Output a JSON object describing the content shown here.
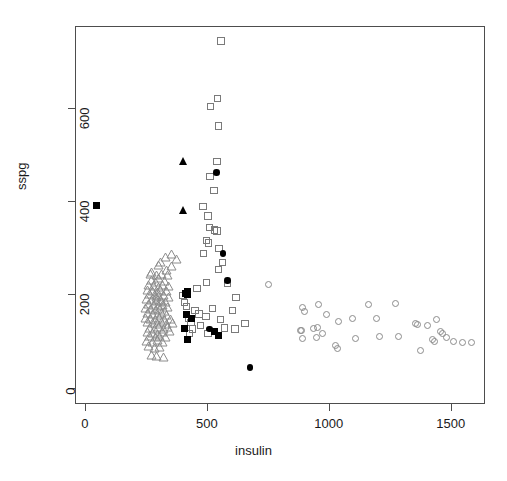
{
  "chart_data": {
    "type": "scatter",
    "title": "",
    "xlabel": "insulin",
    "ylabel": "sspg",
    "xlim": [
      -40,
      1640
    ],
    "ylim": [
      -35,
      775
    ],
    "grid": false,
    "legend": "none",
    "xticks": [
      0,
      500,
      1000,
      1500
    ],
    "xticklabels": [
      "0",
      "500",
      "1000",
      "1500"
    ],
    "yticks": [
      0,
      200,
      400,
      600
    ],
    "yticklabels": [
      "0",
      "200",
      "400",
      "600"
    ],
    "series": [
      {
        "name": "normal",
        "marker": "triangle-open",
        "color": "#8c8c8c",
        "points": [
          [
            352,
            288
          ],
          [
            328,
            283
          ],
          [
            370,
            277
          ],
          [
            305,
            272
          ],
          [
            300,
            265
          ],
          [
            350,
            262
          ],
          [
            265,
            245
          ],
          [
            288,
            243
          ],
          [
            312,
            246
          ],
          [
            333,
            244
          ],
          [
            300,
            238
          ],
          [
            268,
            232
          ],
          [
            286,
            228
          ],
          [
            322,
            231
          ],
          [
            258,
            222
          ],
          [
            278,
            220
          ],
          [
            296,
            218
          ],
          [
            314,
            222
          ],
          [
            340,
            220
          ],
          [
            252,
            212
          ],
          [
            272,
            210
          ],
          [
            292,
            208
          ],
          [
            308,
            212
          ],
          [
            330,
            209
          ],
          [
            260,
            202
          ],
          [
            280,
            200
          ],
          [
            300,
            198
          ],
          [
            318,
            200
          ],
          [
            338,
            196
          ],
          [
            248,
            192
          ],
          [
            268,
            190
          ],
          [
            288,
            188
          ],
          [
            306,
            190
          ],
          [
            326,
            186
          ],
          [
            256,
            182
          ],
          [
            276,
            180
          ],
          [
            296,
            178
          ],
          [
            314,
            180
          ],
          [
            334,
            176
          ],
          [
            246,
            172
          ],
          [
            266,
            170
          ],
          [
            286,
            168
          ],
          [
            304,
            170
          ],
          [
            324,
            166
          ],
          [
            254,
            162
          ],
          [
            274,
            160
          ],
          [
            294,
            158
          ],
          [
            312,
            162
          ],
          [
            332,
            158
          ],
          [
            244,
            152
          ],
          [
            264,
            150
          ],
          [
            284,
            148
          ],
          [
            302,
            152
          ],
          [
            322,
            148
          ],
          [
            252,
            142
          ],
          [
            272,
            140
          ],
          [
            292,
            138
          ],
          [
            310,
            142
          ],
          [
            330,
            138
          ],
          [
            262,
            130
          ],
          [
            282,
            128
          ],
          [
            300,
            132
          ],
          [
            320,
            128
          ],
          [
            254,
            122
          ],
          [
            274,
            120
          ],
          [
            294,
            118
          ],
          [
            314,
            122
          ],
          [
            342,
            124
          ],
          [
            262,
            112
          ],
          [
            284,
            110
          ],
          [
            304,
            113
          ],
          [
            326,
            110
          ],
          [
            250,
            102
          ],
          [
            272,
            100
          ],
          [
            292,
            104
          ],
          [
            316,
            100
          ],
          [
            258,
            92
          ],
          [
            280,
            88
          ],
          [
            302,
            90
          ],
          [
            268,
            72
          ],
          [
            290,
            70
          ],
          [
            318,
            68
          ],
          [
            336,
            132
          ],
          [
            346,
            150
          ],
          [
            356,
            140
          ],
          [
            290,
            196
          ],
          [
            310,
            188
          ],
          [
            270,
            250
          ],
          [
            330,
            255
          ]
        ]
      },
      {
        "name": "chemical",
        "marker": "square-open",
        "color": "#7a7a7a",
        "points": [
          [
            555,
            745
          ],
          [
            540,
            622
          ],
          [
            512,
            605
          ],
          [
            543,
            563
          ],
          [
            538,
            487
          ],
          [
            510,
            455
          ],
          [
            525,
            425
          ],
          [
            480,
            390
          ],
          [
            500,
            370
          ],
          [
            508,
            345
          ],
          [
            528,
            340
          ],
          [
            538,
            338
          ],
          [
            495,
            318
          ],
          [
            503,
            312
          ],
          [
            545,
            300
          ],
          [
            482,
            290
          ],
          [
            560,
            270
          ],
          [
            543,
            255
          ],
          [
            580,
            225
          ],
          [
            494,
            228
          ],
          [
            616,
            195
          ],
          [
            520,
            172
          ],
          [
            602,
            168
          ],
          [
            493,
            155
          ],
          [
            552,
            148
          ],
          [
            652,
            140
          ],
          [
            463,
            160
          ],
          [
            470,
            135
          ],
          [
            420,
            150
          ],
          [
            432,
            142
          ],
          [
            448,
            168
          ],
          [
            412,
            176
          ],
          [
            568,
            130
          ],
          [
            612,
            128
          ],
          [
            438,
            128
          ],
          [
            405,
            185
          ],
          [
            398,
            200
          ],
          [
            455,
            215
          ],
          [
            425,
            118
          ],
          [
            500,
            118
          ]
        ]
      },
      {
        "name": "overt",
        "marker": "circle-open",
        "color": "#8c8c8c",
        "points": [
          [
            748,
            223
          ],
          [
            890,
            175
          ],
          [
            898,
            165
          ],
          [
            955,
            180
          ],
          [
            985,
            158
          ],
          [
            880,
            125
          ],
          [
            886,
            124
          ],
          [
            935,
            128
          ],
          [
            948,
            132
          ],
          [
            890,
            108
          ],
          [
            945,
            110
          ],
          [
            970,
            118
          ],
          [
            1022,
            92
          ],
          [
            1032,
            86
          ],
          [
            1035,
            145
          ],
          [
            1095,
            150
          ],
          [
            1105,
            108
          ],
          [
            1160,
            180
          ],
          [
            1192,
            150
          ],
          [
            1205,
            112
          ],
          [
            1268,
            182
          ],
          [
            1282,
            112
          ],
          [
            1350,
            140
          ],
          [
            1358,
            138
          ],
          [
            1372,
            82
          ],
          [
            1400,
            135
          ],
          [
            1438,
            148
          ],
          [
            1452,
            122
          ],
          [
            1460,
            118
          ],
          [
            1480,
            110
          ],
          [
            1505,
            102
          ],
          [
            1545,
            100
          ],
          [
            1582,
            98
          ],
          [
            1420,
            105
          ],
          [
            1430,
            102
          ]
        ]
      },
      {
        "name": "highlighted-square",
        "marker": "square-solid",
        "color": "#000000",
        "points": [
          [
            45,
            393
          ],
          [
            408,
            205
          ],
          [
            415,
            202
          ],
          [
            418,
            208
          ],
          [
            412,
            160
          ],
          [
            432,
            150
          ],
          [
            406,
            128
          ],
          [
            415,
            105
          ],
          [
            528,
            122
          ],
          [
            545,
            115
          ]
        ]
      },
      {
        "name": "highlighted-triangle",
        "marker": "triangle-solid",
        "color": "#000000",
        "points": [
          [
            400,
            487
          ],
          [
            400,
            382
          ]
        ]
      },
      {
        "name": "highlighted-circle",
        "marker": "circle-solid",
        "color": "#000000",
        "points": [
          [
            535,
            463
          ],
          [
            562,
            290
          ],
          [
            580,
            232
          ],
          [
            672,
            45
          ],
          [
            508,
            128
          ]
        ]
      }
    ]
  },
  "axes": {
    "x_title": "insulin",
    "y_title": "sspg"
  }
}
